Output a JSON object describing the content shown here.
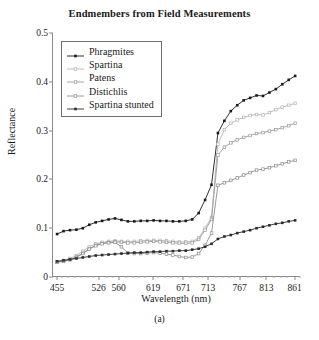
{
  "chart_data": {
    "type": "line",
    "title": "Endmembers from Field Measurements",
    "xlabel": "Wavelength (nm)",
    "ylabel": "Reflectance",
    "caption": "(a)",
    "xlim": [
      448,
      872
    ],
    "ylim": [
      0,
      0.5
    ],
    "xtick_labels": [
      "455",
      "526",
      "560",
      "619",
      "671",
      "713",
      "767",
      "813",
      "861"
    ],
    "xtick_values": [
      455,
      526,
      560,
      619,
      671,
      713,
      767,
      813,
      861
    ],
    "ytick_labels": [
      "0",
      "0.1",
      "0.2",
      "0.3",
      "0.4",
      "0.5"
    ],
    "ytick_values": [
      0,
      0.1,
      0.2,
      0.3,
      0.4,
      0.5
    ],
    "grid": false,
    "legend_position": "upper-left",
    "x": [
      455,
      466,
      477,
      488,
      499,
      510,
      521,
      532,
      543,
      554,
      565,
      576,
      587,
      598,
      609,
      620,
      631,
      642,
      653,
      664,
      675,
      686,
      697,
      708,
      719,
      730,
      741,
      752,
      763,
      774,
      785,
      796,
      807,
      818,
      829,
      840,
      851,
      862
    ],
    "series": [
      {
        "name": "Phragmites",
        "color": "#1a1a1a",
        "marker": "filled-square",
        "values": [
          0.088,
          0.094,
          0.096,
          0.097,
          0.1,
          0.107,
          0.112,
          0.115,
          0.118,
          0.12,
          0.117,
          0.114,
          0.114,
          0.115,
          0.115,
          0.116,
          0.115,
          0.115,
          0.114,
          0.114,
          0.115,
          0.118,
          0.131,
          0.158,
          0.189,
          0.295,
          0.32,
          0.34,
          0.352,
          0.362,
          0.367,
          0.372,
          0.371,
          0.378,
          0.385,
          0.395,
          0.404,
          0.412
        ]
      },
      {
        "name": "Spartina",
        "color": "#b4b4b4",
        "marker": "open-square",
        "values": [
          0.031,
          0.034,
          0.038,
          0.044,
          0.053,
          0.062,
          0.068,
          0.071,
          0.073,
          0.074,
          0.073,
          0.073,
          0.073,
          0.074,
          0.075,
          0.075,
          0.075,
          0.074,
          0.073,
          0.072,
          0.072,
          0.073,
          0.08,
          0.1,
          0.122,
          0.272,
          0.302,
          0.315,
          0.322,
          0.327,
          0.331,
          0.333,
          0.332,
          0.337,
          0.343,
          0.348,
          0.352,
          0.356
        ]
      },
      {
        "name": "Patens",
        "color": "#9a9a9a",
        "marker": "open-square",
        "values": [
          0.031,
          0.033,
          0.036,
          0.041,
          0.049,
          0.058,
          0.065,
          0.069,
          0.071,
          0.072,
          0.071,
          0.07,
          0.07,
          0.071,
          0.072,
          0.073,
          0.072,
          0.071,
          0.07,
          0.069,
          0.069,
          0.07,
          0.077,
          0.096,
          0.118,
          0.25,
          0.266,
          0.275,
          0.281,
          0.286,
          0.29,
          0.294,
          0.296,
          0.299,
          0.302,
          0.306,
          0.31,
          0.315
        ]
      },
      {
        "name": "Distichlis",
        "color": "#8e8e8e",
        "marker": "open-square",
        "values": [
          0.03,
          0.032,
          0.035,
          0.04,
          0.048,
          0.057,
          0.064,
          0.068,
          0.07,
          0.071,
          0.062,
          0.049,
          0.048,
          0.048,
          0.049,
          0.05,
          0.049,
          0.047,
          0.045,
          0.042,
          0.04,
          0.041,
          0.048,
          0.065,
          0.09,
          0.188,
          0.193,
          0.198,
          0.203,
          0.209,
          0.214,
          0.219,
          0.221,
          0.224,
          0.228,
          0.232,
          0.236,
          0.239
        ]
      },
      {
        "name": "Spartina stunted",
        "color": "#2b2b2b",
        "marker": "filled-square",
        "values": [
          0.032,
          0.034,
          0.036,
          0.038,
          0.04,
          0.042,
          0.044,
          0.045,
          0.046,
          0.047,
          0.048,
          0.049,
          0.05,
          0.05,
          0.051,
          0.052,
          0.052,
          0.053,
          0.053,
          0.054,
          0.054,
          0.056,
          0.058,
          0.062,
          0.068,
          0.078,
          0.083,
          0.086,
          0.09,
          0.093,
          0.096,
          0.1,
          0.103,
          0.106,
          0.109,
          0.111,
          0.114,
          0.116
        ]
      }
    ]
  }
}
